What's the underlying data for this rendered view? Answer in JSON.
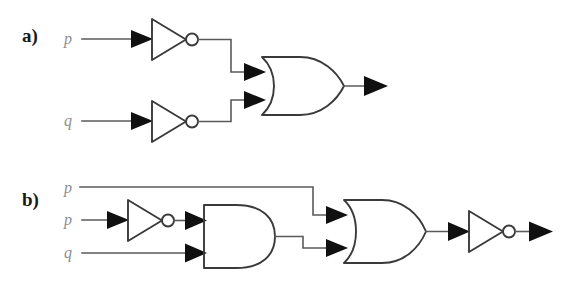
{
  "figure": {
    "background_color": "#ffffff",
    "wire_color": "#5a5a5a",
    "gate_color": "#3a3a3a",
    "label_color": "#1a1a1a",
    "signal_label_color": "#8d8d8d",
    "arrow_color": "#101010",
    "width": 574,
    "height": 284
  },
  "parts": [
    {
      "id": "a",
      "label": "a)",
      "inputs": [
        {
          "name": "p",
          "label": "p"
        },
        {
          "name": "q",
          "label": "q"
        }
      ],
      "gates": [
        {
          "name": "not-gate-top",
          "type": "NOT"
        },
        {
          "name": "not-gate-bottom",
          "type": "NOT"
        },
        {
          "name": "or-gate",
          "type": "OR"
        }
      ],
      "outputs": [
        {
          "name": "output-arrow",
          "label": ""
        }
      ]
    },
    {
      "id": "b",
      "label": "b)",
      "inputs": [
        {
          "name": "p-top",
          "label": "p"
        },
        {
          "name": "p-middle",
          "label": "p"
        },
        {
          "name": "q-bottom",
          "label": "q"
        }
      ],
      "gates": [
        {
          "name": "not-gate-input",
          "type": "NOT"
        },
        {
          "name": "and-gate",
          "type": "AND"
        },
        {
          "name": "or-gate",
          "type": "OR"
        },
        {
          "name": "not-gate-output",
          "type": "NOT"
        }
      ],
      "outputs": [
        {
          "name": "output-arrow",
          "label": ""
        }
      ]
    }
  ]
}
